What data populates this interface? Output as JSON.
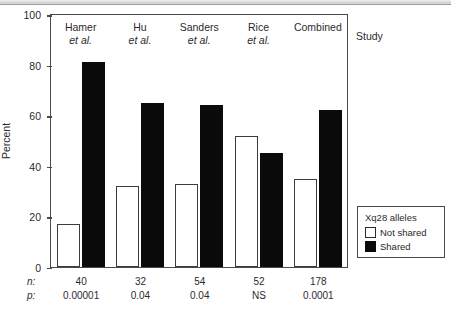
{
  "chart_data": {
    "type": "bar",
    "title": "",
    "xlabel": "Study",
    "ylabel": "Percent",
    "ylim": [
      0,
      100
    ],
    "yticks": [
      0,
      20,
      40,
      60,
      80,
      100
    ],
    "grid": false,
    "legend_position": "bottom-right",
    "legend_title": "Xq28 alleles",
    "categories": [
      "Hamer et al.",
      "Hu et al.",
      "Sanders et al.",
      "Rice et al.",
      "Combined"
    ],
    "series": [
      {
        "name": "Not shared",
        "color": "#ffffff",
        "values": [
          17,
          32,
          33,
          52,
          35
        ]
      },
      {
        "name": "Shared",
        "color": "#000000",
        "values": [
          81,
          65,
          64,
          45,
          62
        ]
      }
    ],
    "annotations": {
      "n_label": "n:",
      "p_label": "p:",
      "n_values": [
        "40",
        "32",
        "54",
        "52",
        "178"
      ],
      "p_values": [
        "0.00001",
        "0.04",
        "0.04",
        "NS",
        "0.0001"
      ]
    }
  },
  "axes": {
    "y_title": "Percent",
    "y_tick_labels": [
      "100",
      "80",
      "60",
      "40",
      "20",
      "0"
    ],
    "x_title": "Study"
  },
  "groups": [
    {
      "name": "Hamer",
      "etal": "et al.",
      "not_shared": 17,
      "shared": 81
    },
    {
      "name": "Hu",
      "etal": "et al.",
      "not_shared": 32,
      "shared": 65
    },
    {
      "name": "Sanders",
      "etal": "et al.",
      "not_shared": 33,
      "shared": 64
    },
    {
      "name": "Rice",
      "etal": "et al.",
      "not_shared": 52,
      "shared": 45
    },
    {
      "name": "Combined",
      "etal": "",
      "not_shared": 35,
      "shared": 62
    }
  ],
  "legend": {
    "title": "Xq28 alleles",
    "items": [
      {
        "label": "Not shared",
        "swatch": "white"
      },
      {
        "label": "Shared",
        "swatch": "black"
      }
    ]
  },
  "stats": {
    "n_key": "n:",
    "p_key": "p:",
    "n": [
      "40",
      "32",
      "54",
      "52",
      "178"
    ],
    "p": [
      "0.00001",
      "0.04",
      "0.04",
      "NS",
      "0.0001"
    ]
  },
  "colors": {
    "bar_shared": "#000000",
    "bar_not_shared": "#ffffff",
    "axis": "#4a4a4a",
    "text": "#2b2b2b",
    "background": "#ffffff"
  }
}
